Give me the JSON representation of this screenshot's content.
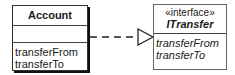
{
  "diagram": {
    "type": "uml-class-realization",
    "classes": [
      {
        "id": "account",
        "name": "Account",
        "stereotype": "",
        "operations_compartment": "",
        "attributes": [
          "transferFrom",
          "transferTo"
        ]
      },
      {
        "id": "itransfer",
        "name": "ITransfer",
        "stereotype": "«interface»",
        "attributes": [
          "transferFrom",
          "transferTo"
        ]
      }
    ],
    "relationship": {
      "from": "Account",
      "to": "ITransfer",
      "kind": "realization",
      "line_style": "dashed",
      "arrowhead": "hollow-triangle"
    },
    "colors": {
      "line": "#222222",
      "shadow": "#111111",
      "background": "#ffffff"
    }
  }
}
